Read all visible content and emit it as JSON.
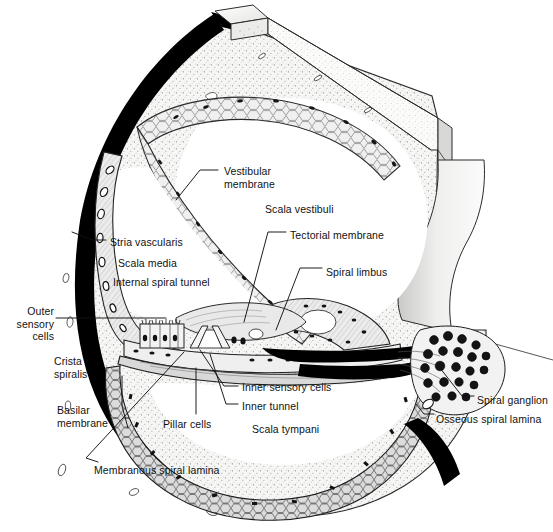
{
  "figure": {
    "type": "anatomical-line-diagram",
    "colors": {
      "ink": "#111111",
      "bone_fill": "#f4f4f2",
      "stipple": "#6f6f6f",
      "dense_bone": "#000000",
      "tissue_shade": "#9a9a9a",
      "lumen": "#ffffff"
    }
  },
  "labels": [
    {
      "id": "vestibular-membrane",
      "text": "Vestibular\nmembrane",
      "x": 224,
      "y": 165,
      "align": "left"
    },
    {
      "id": "scala-vestibuli",
      "text": "Scala vestibuli",
      "x": 265,
      "y": 203,
      "align": "left"
    },
    {
      "id": "tectorial-membrane",
      "text": "Tectorial membrane",
      "x": 290,
      "y": 229,
      "align": "left"
    },
    {
      "id": "stria-vascularis",
      "text": "Stria vascularis",
      "x": 110,
      "y": 236,
      "align": "left"
    },
    {
      "id": "scala-media",
      "text": "Scala media",
      "x": 118,
      "y": 257,
      "align": "left"
    },
    {
      "id": "spiral-limbus",
      "text": "Spiral limbus",
      "x": 326,
      "y": 266,
      "align": "left"
    },
    {
      "id": "internal-spiral-tunnel",
      "text": "Internal spiral tunnel",
      "x": 113,
      "y": 276,
      "align": "left"
    },
    {
      "id": "outer-sensory-cells",
      "text": "Outer\nsensory\ncells",
      "x": 52,
      "y": 305,
      "align": "right"
    },
    {
      "id": "crista-spiralis",
      "text": "Crista\nspiralis",
      "x": 54,
      "y": 355,
      "align": "left"
    },
    {
      "id": "inner-sensory-cells",
      "text": "Inner sensory cells",
      "x": 242,
      "y": 381,
      "align": "left"
    },
    {
      "id": "inner-tunnel",
      "text": "Inner tunnel",
      "x": 242,
      "y": 400,
      "align": "left"
    },
    {
      "id": "spiral-ganglion",
      "text": "Spiral ganglion",
      "x": 477,
      "y": 394,
      "align": "left"
    },
    {
      "id": "basilar-membrane",
      "text": "Basilar\nmembrane",
      "x": 57,
      "y": 404,
      "align": "left"
    },
    {
      "id": "pillar-cells",
      "text": "Pillar cells",
      "x": 163,
      "y": 418,
      "align": "left"
    },
    {
      "id": "scala-tympani",
      "text": "Scala tympani",
      "x": 252,
      "y": 423,
      "align": "left"
    },
    {
      "id": "osseous-spiral-lamina",
      "text": "Osseous spiral lamina",
      "x": 436,
      "y": 413,
      "align": "left"
    },
    {
      "id": "membranous-spiral-lamina",
      "text": "Membranous spiral lamina",
      "x": 94,
      "y": 464,
      "align": "left"
    }
  ],
  "structures": [
    "outer bony wall (dense black)",
    "otic capsule bone with stipple texture",
    "scala vestibuli lumen",
    "scala media lumen",
    "scala tympani lumen",
    "vestibular (Reissner's) membrane",
    "stria vascularis with capillaries",
    "spiral ligament",
    "spiral limbus",
    "tectorial membrane",
    "organ of Corti with hair cells and pillar cells",
    "basilar membrane",
    "osseous spiral lamina",
    "spiral ganglion neurons",
    "modiolus wall cut-away wedge"
  ]
}
